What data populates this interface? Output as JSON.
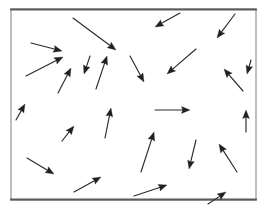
{
  "figure": {
    "kind": "vector-field-arrow-diagram",
    "title": "",
    "caption": "",
    "width": 269,
    "height": 216,
    "background_color": "#ffffff",
    "arrow_color": "#202020",
    "frame_color": "#8a8a8a",
    "frame_heavy_color": "#5a5a5a",
    "frame": {
      "x": 11,
      "y": 9,
      "width": 245,
      "height": 191,
      "stroke_width": 1.1,
      "heavy_edges": [
        "top",
        "bottom"
      ]
    }
  },
  "chart_data": {
    "type": "scatter",
    "subtype": "quiver",
    "title": "",
    "xlabel": "",
    "ylabel": "",
    "xlim": [
      11,
      256
    ],
    "ylim": [
      9,
      200
    ],
    "grid": false,
    "legend": null,
    "annotations": [],
    "arrow_count": 24,
    "arrow_columns": [
      "x1",
      "y1",
      "x2",
      "y2"
    ],
    "arrows": [
      {
        "id": "a01",
        "x1": 31,
        "y1": 43,
        "x2": 62,
        "y2": 51,
        "angle_deg": 14
      },
      {
        "id": "a02",
        "x1": 26,
        "y1": 76,
        "x2": 63,
        "y2": 57,
        "angle_deg": -27
      },
      {
        "id": "a03",
        "x1": 73,
        "y1": 18,
        "x2": 116,
        "y2": 50,
        "angle_deg": 37
      },
      {
        "id": "a04",
        "x1": 96,
        "y1": 89,
        "x2": 107,
        "y2": 56,
        "angle_deg": -72
      },
      {
        "id": "a05",
        "x1": 130,
        "y1": 56,
        "x2": 144,
        "y2": 82,
        "angle_deg": 62
      },
      {
        "id": "a06",
        "x1": 180,
        "y1": 13,
        "x2": 155,
        "y2": 27,
        "angle_deg": 151
      },
      {
        "id": "a07",
        "x1": 235,
        "y1": 14,
        "x2": 217,
        "y2": 38,
        "angle_deg": 127
      },
      {
        "id": "a08",
        "x1": 196,
        "y1": 49,
        "x2": 167,
        "y2": 74,
        "angle_deg": 139
      },
      {
        "id": "a09",
        "x1": 243,
        "y1": 91,
        "x2": 224,
        "y2": 69,
        "angle_deg": -131
      },
      {
        "id": "a10",
        "x1": 155,
        "y1": 110,
        "x2": 190,
        "y2": 110,
        "angle_deg": 0
      },
      {
        "id": "a11",
        "x1": 105,
        "y1": 138,
        "x2": 111,
        "y2": 108,
        "angle_deg": -79
      },
      {
        "id": "a12",
        "x1": 62,
        "y1": 141,
        "x2": 74,
        "y2": 126,
        "angle_deg": -51
      },
      {
        "id": "a13",
        "x1": 246,
        "y1": 132,
        "x2": 246,
        "y2": 110,
        "angle_deg": -90
      },
      {
        "id": "a14",
        "x1": 141,
        "y1": 172,
        "x2": 154,
        "y2": 132,
        "angle_deg": -72
      },
      {
        "id": "a15",
        "x1": 27,
        "y1": 158,
        "x2": 54,
        "y2": 174,
        "angle_deg": 31
      },
      {
        "id": "a16",
        "x1": 196,
        "y1": 140,
        "x2": 189,
        "y2": 169,
        "angle_deg": 103
      },
      {
        "id": "a17",
        "x1": 237,
        "y1": 172,
        "x2": 219,
        "y2": 144,
        "angle_deg": -123
      },
      {
        "id": "a18",
        "x1": 74,
        "y1": 192,
        "x2": 101,
        "y2": 177,
        "angle_deg": -29
      },
      {
        "id": "a19",
        "x1": 134,
        "y1": 196,
        "x2": 167,
        "y2": 185,
        "angle_deg": -18
      },
      {
        "id": "a20",
        "x1": 208,
        "y1": 204,
        "x2": 226,
        "y2": 192,
        "angle_deg": -34
      },
      {
        "id": "a21",
        "x1": 58,
        "y1": 93,
        "x2": 71,
        "y2": 68,
        "angle_deg": -63
      },
      {
        "id": "a22",
        "x1": 90,
        "y1": 56,
        "x2": 84,
        "y2": 74,
        "angle_deg": 108
      },
      {
        "id": "a23",
        "x1": 16,
        "y1": 120,
        "x2": 25,
        "y2": 104,
        "angle_deg": -61
      },
      {
        "id": "a24",
        "x1": 251,
        "y1": 60,
        "x2": 247,
        "y2": 74,
        "angle_deg": 106
      }
    ]
  }
}
